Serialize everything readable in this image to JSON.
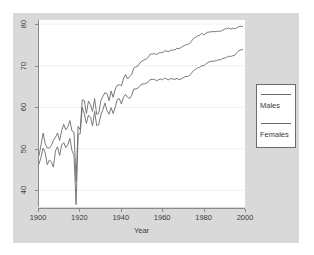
{
  "chart_data": {
    "type": "line",
    "title": "",
    "xlabel": "Year",
    "ylabel": "",
    "xlim": [
      1900,
      2000
    ],
    "ylim": [
      36,
      81
    ],
    "xticks": [
      1900,
      1920,
      1940,
      1960,
      1980,
      2000
    ],
    "yticks": [
      40,
      50,
      60,
      70,
      80
    ],
    "grid": "horizontal-faint",
    "legend_position": "right-outside",
    "legend": [
      "Males",
      "Females"
    ],
    "series": [
      {
        "name": "Females",
        "color": "#6b6b6b",
        "x": [
          1900,
          1901,
          1902,
          1903,
          1904,
          1905,
          1906,
          1907,
          1908,
          1909,
          1910,
          1911,
          1912,
          1913,
          1914,
          1915,
          1916,
          1917,
          1918,
          1919,
          1920,
          1921,
          1922,
          1923,
          1924,
          1925,
          1926,
          1927,
          1928,
          1929,
          1930,
          1931,
          1932,
          1933,
          1934,
          1935,
          1936,
          1937,
          1938,
          1939,
          1940,
          1941,
          1942,
          1943,
          1944,
          1945,
          1946,
          1947,
          1948,
          1949,
          1950,
          1951,
          1952,
          1953,
          1954,
          1955,
          1956,
          1957,
          1958,
          1959,
          1960,
          1961,
          1962,
          1963,
          1964,
          1965,
          1966,
          1967,
          1968,
          1969,
          1970,
          1971,
          1972,
          1973,
          1974,
          1975,
          1976,
          1977,
          1978,
          1979,
          1980,
          1981,
          1982,
          1983,
          1984,
          1985,
          1986,
          1987,
          1988,
          1989,
          1990,
          1991,
          1992,
          1993,
          1994,
          1995,
          1996,
          1997,
          1998,
          1999
        ],
        "values": [
          48.3,
          51.0,
          53.8,
          51.3,
          50.2,
          50.2,
          50.8,
          52.0,
          52.8,
          53.8,
          52.0,
          54.4,
          55.9,
          54.6,
          55.3,
          56.8,
          54.3,
          54.0,
          42.2,
          55.4,
          54.6,
          61.8,
          61.6,
          58.5,
          61.5,
          60.6,
          59.0,
          62.1,
          58.3,
          58.5,
          61.6,
          62.6,
          63.5,
          63.3,
          61.6,
          63.9,
          62.4,
          64.4,
          65.3,
          65.4,
          65.2,
          66.8,
          67.9,
          66.8,
          67.4,
          67.9,
          69.4,
          69.7,
          69.9,
          70.7,
          71.1,
          71.4,
          71.6,
          72.0,
          72.8,
          72.8,
          72.9,
          72.7,
          73.0,
          73.2,
          73.1,
          73.6,
          73.5,
          73.4,
          73.7,
          73.8,
          73.8,
          74.2,
          74.1,
          74.4,
          74.7,
          75.0,
          75.1,
          75.3,
          75.9,
          76.6,
          76.8,
          77.2,
          77.3,
          77.8,
          77.4,
          77.8,
          78.1,
          78.1,
          78.2,
          78.2,
          78.2,
          78.3,
          78.3,
          78.5,
          78.8,
          78.9,
          79.1,
          78.8,
          79.0,
          78.9,
          79.1,
          79.4,
          79.5,
          79.4
        ]
      },
      {
        "name": "Males",
        "color": "#6b6b6b",
        "x": [
          1900,
          1901,
          1902,
          1903,
          1904,
          1905,
          1906,
          1907,
          1908,
          1909,
          1910,
          1911,
          1912,
          1913,
          1914,
          1915,
          1916,
          1917,
          1918,
          1919,
          1920,
          1921,
          1922,
          1923,
          1924,
          1925,
          1926,
          1927,
          1928,
          1929,
          1930,
          1931,
          1932,
          1933,
          1934,
          1935,
          1936,
          1937,
          1938,
          1939,
          1940,
          1941,
          1942,
          1943,
          1944,
          1945,
          1946,
          1947,
          1948,
          1949,
          1950,
          1951,
          1952,
          1953,
          1954,
          1955,
          1956,
          1957,
          1958,
          1959,
          1960,
          1961,
          1962,
          1963,
          1964,
          1965,
          1966,
          1967,
          1968,
          1969,
          1970,
          1971,
          1972,
          1973,
          1974,
          1975,
          1976,
          1977,
          1978,
          1979,
          1980,
          1981,
          1982,
          1983,
          1984,
          1985,
          1986,
          1987,
          1988,
          1989,
          1990,
          1991,
          1992,
          1993,
          1994,
          1995,
          1996,
          1997,
          1998,
          1999
        ],
        "values": [
          46.3,
          48.0,
          50.2,
          49.1,
          46.2,
          47.3,
          46.9,
          45.6,
          49.5,
          50.5,
          48.4,
          50.9,
          51.5,
          50.3,
          51.0,
          52.5,
          49.6,
          48.4,
          36.6,
          53.5,
          53.6,
          60.0,
          58.4,
          56.1,
          58.1,
          57.6,
          55.5,
          59.0,
          55.6,
          55.8,
          58.1,
          59.4,
          61.0,
          59.2,
          58.3,
          59.9,
          58.5,
          60.0,
          61.9,
          62.1,
          60.8,
          62.4,
          63.1,
          62.4,
          62.1,
          62.9,
          64.4,
          64.4,
          64.6,
          65.2,
          65.6,
          65.6,
          65.8,
          66.0,
          66.7,
          66.7,
          66.7,
          66.4,
          66.6,
          66.8,
          66.6,
          67.0,
          66.8,
          66.6,
          66.9,
          66.8,
          66.7,
          67.0,
          66.6,
          66.8,
          67.1,
          67.4,
          67.4,
          67.6,
          68.2,
          68.8,
          69.1,
          69.5,
          69.6,
          70.0,
          70.0,
          70.4,
          70.8,
          71.0,
          71.1,
          71.1,
          71.2,
          71.4,
          71.4,
          71.7,
          71.8,
          72.0,
          72.3,
          72.2,
          72.4,
          72.5,
          73.1,
          73.6,
          73.8,
          73.9
        ]
      }
    ]
  },
  "axis": {
    "y_tick_labels": [
      "40",
      "50",
      "60",
      "70",
      "80"
    ],
    "x_tick_labels": [
      "1900",
      "1920",
      "1940",
      "1960",
      "1980",
      "2000"
    ],
    "x_title": "Year"
  },
  "legend": {
    "entries": [
      {
        "label": "Males"
      },
      {
        "label": "Females"
      }
    ]
  },
  "colors": {
    "figure_background": "#ffffff",
    "panel_background": "#d9d9d9",
    "plot_background": "#ffffff",
    "line": "#6b6b6b",
    "axis": "#8a8a8a",
    "text": "#3a3a3a",
    "grid": "#f0f0f0"
  }
}
